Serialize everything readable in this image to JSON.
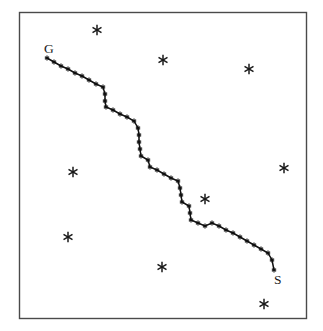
{
  "figure": {
    "background_color": "#ffffff",
    "frame": {
      "x": 19,
      "y": 12,
      "width": 287,
      "height": 306,
      "stroke_color": "#4a4a4a"
    }
  },
  "labels": [
    {
      "text": "G",
      "name": "goal-label",
      "x": 44,
      "y": 53
    },
    {
      "text": "S",
      "name": "start-label",
      "x": 274,
      "y": 284
    }
  ],
  "chart_data": {
    "type": "scatter",
    "xlabel": "",
    "ylabel": "",
    "xlim": [
      19,
      306
    ],
    "ylim": [
      12,
      318
    ],
    "grid": false,
    "legend": "none",
    "annotations": [
      {
        "label": "G",
        "meaning": "goal",
        "x": 47,
        "y": 58
      },
      {
        "label": "S",
        "meaning": "start",
        "x": 274,
        "y": 270
      }
    ],
    "series": [
      {
        "name": "planned-path",
        "marker": "star",
        "color": "#111111",
        "points": [
          [
            47,
            58
          ],
          [
            54,
            62
          ],
          [
            61,
            66
          ],
          [
            68,
            69
          ],
          [
            75,
            73
          ],
          [
            82,
            76
          ],
          [
            89,
            80
          ],
          [
            96,
            84
          ],
          [
            103,
            87
          ],
          [
            105,
            94
          ],
          [
            105,
            101
          ],
          [
            106,
            107
          ],
          [
            113,
            110
          ],
          [
            120,
            114
          ],
          [
            127,
            117
          ],
          [
            134,
            121
          ],
          [
            138,
            128
          ],
          [
            139,
            135
          ],
          [
            139,
            142
          ],
          [
            140,
            149
          ],
          [
            141,
            156
          ],
          [
            148,
            160
          ],
          [
            150,
            167
          ],
          [
            157,
            170
          ],
          [
            164,
            174
          ],
          [
            171,
            178
          ],
          [
            178,
            181
          ],
          [
            180,
            188
          ],
          [
            181,
            195
          ],
          [
            182,
            202
          ],
          [
            189,
            206
          ],
          [
            190,
            213
          ],
          [
            191,
            220
          ],
          [
            198,
            223
          ],
          [
            205,
            226
          ],
          [
            212,
            223
          ],
          [
            219,
            226
          ],
          [
            226,
            230
          ],
          [
            233,
            233
          ],
          [
            240,
            237
          ],
          [
            247,
            241
          ],
          [
            254,
            245
          ],
          [
            261,
            249
          ],
          [
            268,
            253
          ],
          [
            272,
            260
          ],
          [
            274,
            270
          ]
        ]
      },
      {
        "name": "obstacles",
        "marker": "asterisk",
        "color": "#1a1a1a",
        "points": [
          [
            97,
            30
          ],
          [
            163,
            60
          ],
          [
            249,
            69
          ],
          [
            73,
            172
          ],
          [
            284,
            168
          ],
          [
            205,
            199
          ],
          [
            68,
            237
          ],
          [
            162,
            267
          ],
          [
            264,
            304
          ]
        ]
      }
    ]
  }
}
